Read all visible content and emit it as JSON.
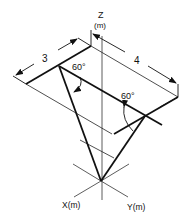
{
  "diagram": {
    "type": "isometric-mechanics-figure",
    "axes": {
      "z_label": "Z",
      "z_unit": "(m)",
      "x_label": "X(m)",
      "y_label": "Y(m)"
    },
    "dimensions": {
      "left_edge": "3",
      "right_edge": "4"
    },
    "angles": {
      "left_angle": "60°",
      "right_angle": "60°"
    },
    "colors": {
      "stroke": "#111111",
      "background": "#ffffff"
    }
  }
}
